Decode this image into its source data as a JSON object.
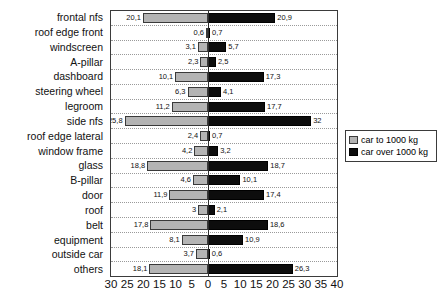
{
  "chart_data": {
    "type": "bar",
    "orientation": "horizontal-diverging",
    "title": "",
    "subtitle": "",
    "xlabel": "",
    "ylabel": "",
    "grid": true,
    "legend_position": "right",
    "axis": {
      "left_max": 30,
      "right_max": 40,
      "tick_step": 5,
      "ticks": [
        "30",
        "25",
        "20",
        "15",
        "10",
        "5",
        "0",
        "5",
        "10",
        "15",
        "20",
        "25",
        "30",
        "35",
        "40"
      ],
      "tick_values": [
        -30,
        -25,
        -20,
        -15,
        -10,
        -5,
        0,
        5,
        10,
        15,
        20,
        25,
        30,
        35,
        40
      ]
    },
    "categories": [
      "frontal nfs",
      "roof edge front",
      "windscreen",
      "A-pillar",
      "dashboard",
      "steering wheel",
      "legroom",
      "side nfs",
      "roof edge lateral",
      "window frame",
      "glass",
      "B-pillar",
      "door",
      "roof",
      "belt",
      "equipment",
      "outside car",
      "others"
    ],
    "series": [
      {
        "name": "car to 1000 kg",
        "side": "left",
        "color": "#b4b4b4",
        "values": [
          20.1,
          0.6,
          3.1,
          2.3,
          10.1,
          6.3,
          11.2,
          25.8,
          2.4,
          4.2,
          18.8,
          4.6,
          11.9,
          3.0,
          17.8,
          8.1,
          3.7,
          18.1
        ],
        "labels": [
          "20,1",
          "0,6",
          "3,1",
          "2,3",
          "10,1",
          "6,3",
          "11,2",
          "25,8",
          "2,4",
          "4,2",
          "18,8",
          "4,6",
          "11,9",
          "3",
          "17,8",
          "8,1",
          "3,7",
          "18,1"
        ]
      },
      {
        "name": "car over 1000 kg",
        "side": "right",
        "color": "#0d0d0d",
        "values": [
          20.9,
          0.7,
          5.7,
          2.5,
          17.3,
          4.1,
          17.7,
          32.0,
          0.7,
          3.2,
          18.7,
          10.1,
          17.4,
          2.1,
          18.6,
          10.9,
          0.6,
          26.3
        ],
        "labels": [
          "20,9",
          "0,7",
          "5,7",
          "2,5",
          "17,3",
          "4,1",
          "17,7",
          "32",
          "0,7",
          "3,2",
          "18,7",
          "10,1",
          "17,4",
          "2,1",
          "18,6",
          "10,9",
          "0,6",
          "26,3"
        ]
      }
    ]
  },
  "legend": {
    "entries": [
      {
        "label": "car to 1000 kg",
        "swatch": "light-gray-swatch"
      },
      {
        "label": "car over 1000 kg",
        "swatch": "black-swatch"
      }
    ]
  }
}
